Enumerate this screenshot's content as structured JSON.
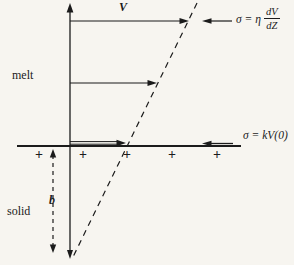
{
  "colors": {
    "ink": "#1b1b1b",
    "paper": "#f7f5f0"
  },
  "regions": {
    "melt": "melt",
    "solid": "solid"
  },
  "labels": {
    "velocity": "V",
    "boundary_layer": "b"
  },
  "equations": {
    "viscous_stress_prefix": "σ = η",
    "viscous_stress_numerator": "dV",
    "viscous_stress_denominator": "dZ",
    "friction_stress": "σ = kV(0)"
  },
  "interface": {
    "plus_signs": [
      "+",
      "+",
      "+",
      "+",
      "+"
    ]
  }
}
